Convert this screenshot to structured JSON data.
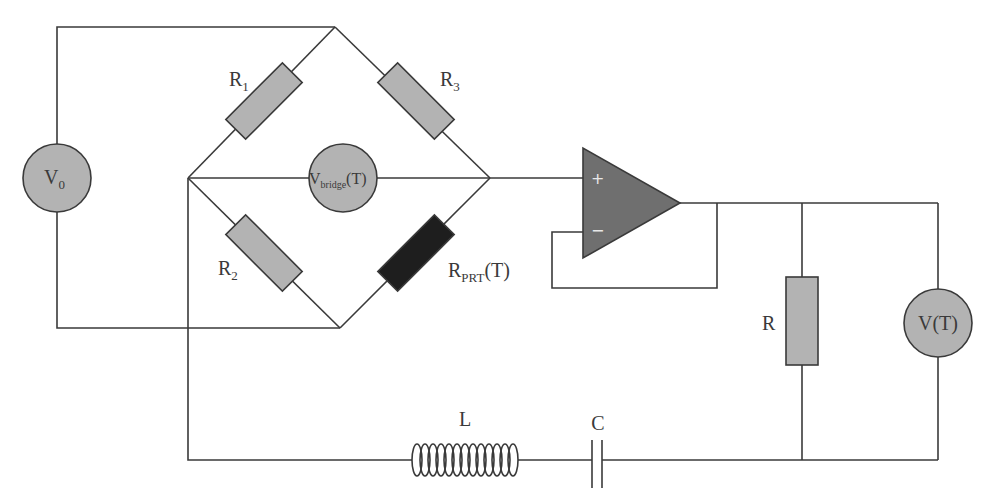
{
  "diagram": {
    "type": "circuit-schematic",
    "colors": {
      "wire": "#3a3a3a",
      "component_fill": "#b3b3b3",
      "prt_fill": "#1e1e1e",
      "opamp_fill": "#6f6f6f",
      "background": "#ffffff"
    },
    "components": {
      "source": {
        "label": "V",
        "subscript": "0"
      },
      "r1": {
        "label": "R",
        "subscript": "1"
      },
      "r2": {
        "label": "R",
        "subscript": "2"
      },
      "r3": {
        "label": "R",
        "subscript": "3"
      },
      "prt": {
        "label": "R",
        "subscript": "PRT",
        "suffix": "(T)"
      },
      "bridge_meter": {
        "label": "V",
        "subscript": "bridge",
        "suffix": "(T)"
      },
      "opamp": {
        "plus": "+",
        "minus": "−"
      },
      "load_resistor": {
        "label": "R"
      },
      "output_meter": {
        "label": "V(T)"
      },
      "inductor": {
        "label": "L"
      },
      "capacitor": {
        "label": "C"
      }
    }
  }
}
